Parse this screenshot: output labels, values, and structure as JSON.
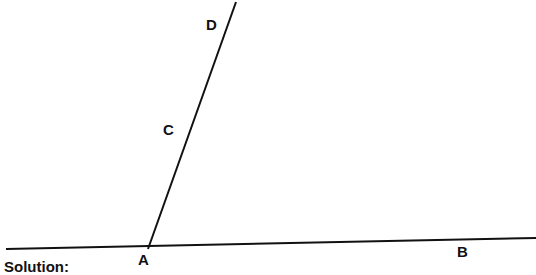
{
  "diagram": {
    "type": "geometry-angle",
    "points": [
      {
        "name": "A",
        "label": "A"
      },
      {
        "name": "B",
        "label": "B"
      },
      {
        "name": "C",
        "label": "C"
      },
      {
        "name": "D",
        "label": "D"
      }
    ],
    "lines": [
      {
        "name": "line-AB",
        "from": "left-edge",
        "to": "right-edge",
        "through": [
          "A",
          "B"
        ]
      },
      {
        "name": "ray-ACD",
        "from": "A",
        "through": [
          "C",
          "D"
        ]
      }
    ],
    "colors": {
      "stroke": "#111111",
      "background": "#ffffff"
    }
  },
  "footer": {
    "solution_label": "Solution:"
  }
}
